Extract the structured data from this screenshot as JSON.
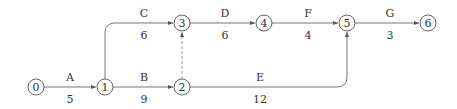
{
  "diagram": {
    "type": "activity-on-arrow network",
    "nodes": [
      {
        "id": "0",
        "label": "0",
        "x": 36,
        "y": 87
      },
      {
        "id": "1",
        "label": "1",
        "x": 105,
        "y": 87
      },
      {
        "id": "2",
        "label": "2",
        "x": 182,
        "y": 87
      },
      {
        "id": "3",
        "label": "3",
        "x": 182,
        "y": 23
      },
      {
        "id": "4",
        "label": "4",
        "x": 264,
        "y": 23
      },
      {
        "id": "5",
        "label": "5",
        "x": 347,
        "y": 23
      },
      {
        "id": "6",
        "label": "6",
        "x": 428,
        "y": 23
      }
    ],
    "activities": [
      {
        "name": "A",
        "duration": "5",
        "from": "0",
        "to": "1"
      },
      {
        "name": "B",
        "duration": "9",
        "from": "1",
        "to": "2"
      },
      {
        "name": "C",
        "duration": "6",
        "from": "1",
        "to": "3"
      },
      {
        "name": "D",
        "duration": "6",
        "from": "3",
        "to": "4"
      },
      {
        "name": "E",
        "duration": "12",
        "from": "2",
        "to": "5"
      },
      {
        "name": "F",
        "duration": "4",
        "from": "4",
        "to": "5"
      },
      {
        "name": "G",
        "duration": "3",
        "from": "5",
        "to": "6"
      }
    ],
    "dummy_activities": [
      {
        "from": "2",
        "to": "3",
        "style": "dashed"
      }
    ]
  }
}
